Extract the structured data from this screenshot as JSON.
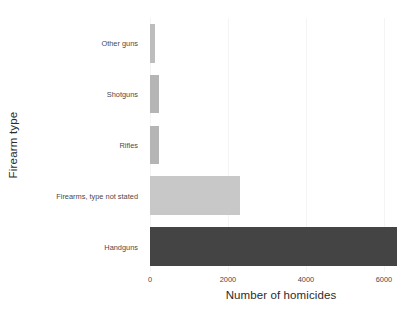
{
  "chart_data": {
    "type": "bar",
    "orientation": "horizontal",
    "title": "",
    "xlabel": "Number of homicides",
    "ylabel": "Firearm type",
    "categories": [
      "Handguns",
      "Firearms, type not stated",
      "Rifles",
      "Shotguns",
      "Other guns"
    ],
    "values": [
      6330,
      2300,
      240,
      230,
      130
    ],
    "bar_colors": [
      "#444444",
      "#c8c8c8",
      "#b5b5b5",
      "#b5b5b5",
      "#bdbdbd"
    ],
    "xlim": [
      0,
      6720
    ],
    "xticks": [
      0,
      2000,
      4000,
      6000
    ],
    "xtick_labels": [
      "0",
      "2000",
      "4000",
      "6000"
    ],
    "ytick_labels": [
      "Other guns",
      "Shotguns",
      "Rifles",
      "Firearms, type not stated",
      "Handguns"
    ],
    "grid": true,
    "grid_color": "#f4f4f4",
    "legend": "none",
    "background": "#ffffff"
  },
  "axes": {
    "x_title": "Number of homicides",
    "y_title": "Firearm type"
  },
  "bars": [
    {
      "label": "Other guns",
      "value": 130,
      "color": "#bdbdbd"
    },
    {
      "label": "Shotguns",
      "value": 230,
      "color": "#b5b5b5"
    },
    {
      "label": "Rifles",
      "value": 240,
      "color": "#b5b5b5"
    },
    {
      "label": "Firearms, type not stated",
      "value": 2300,
      "color": "#c8c8c8"
    },
    {
      "label": "Handguns",
      "value": 6330,
      "color": "#444444"
    }
  ],
  "ticks": {
    "x": [
      {
        "value": 0,
        "label": "0"
      },
      {
        "value": 2000,
        "label": "2000"
      },
      {
        "value": 4000,
        "label": "4000"
      },
      {
        "value": 6000,
        "label": "6000"
      }
    ]
  }
}
